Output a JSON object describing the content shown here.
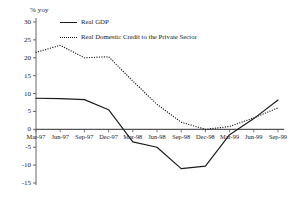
{
  "chart_data": {
    "type": "line",
    "title": "",
    "subtitle": "",
    "ylabel": "% yoy",
    "xlabel": "",
    "ylim": [
      -15,
      30
    ],
    "yticks": [
      30,
      25,
      20,
      15,
      10,
      5,
      0,
      -5,
      -10,
      -15
    ],
    "ytick_labels": [
      "30",
      "25",
      "20",
      "15",
      "10",
      "5",
      "0",
      "-5",
      "-10",
      "-15"
    ],
    "grid": false,
    "legend_position": "top-left inside",
    "categories": [
      "Mar-97",
      "Jun-97",
      "Sep-97",
      "Dec-97",
      "Mar-98",
      "Jun-98",
      "Sep-98",
      "Dec-98",
      "Mar-99",
      "Jun-99",
      "Sep-99"
    ],
    "series": [
      {
        "name": "Real GDP",
        "style": "solid",
        "color": "#1a1a1a",
        "values": [
          8.7,
          8.6,
          8.3,
          5.5,
          -3.5,
          -5.0,
          -11.0,
          -10.3,
          -1.5,
          3.0,
          8.2
        ]
      },
      {
        "name": "Real Domestic Credit to the Private Sector",
        "style": "dotted",
        "color": "#1a1a1a",
        "values": [
          21.5,
          23.5,
          20.0,
          20.3,
          13.5,
          7.0,
          2.0,
          0.0,
          0.8,
          3.2,
          6.0
        ]
      }
    ]
  },
  "axis": {
    "unit_label": "% yoy"
  }
}
